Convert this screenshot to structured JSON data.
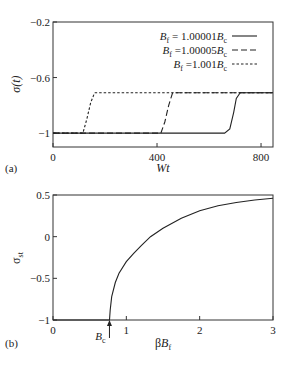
{
  "chart_data": [
    {
      "panel": "(a)",
      "type": "line",
      "xlabel": "Wt",
      "ylabel": "σ(t)",
      "xlim": [
        0,
        846
      ],
      "ylim": [
        -1.1,
        -0.2
      ],
      "xticks": [
        0,
        400,
        800
      ],
      "yticks": [
        -1,
        -0.6,
        -0.2
      ],
      "grid": false,
      "legend_position": "upper right",
      "series": [
        {
          "name": "B_f = 1.00001B_c",
          "style": "solid",
          "x": [
            0,
            660,
            680,
            695,
            705,
            720,
            846
          ],
          "y": [
            -1,
            -1,
            -0.97,
            -0.85,
            -0.75,
            -0.71,
            -0.71
          ]
        },
        {
          "name": "B_f = 1.00005B_c",
          "style": "dashed",
          "x": [
            0,
            415,
            430,
            445,
            460,
            846
          ],
          "y": [
            -1,
            -1,
            -0.92,
            -0.8,
            -0.71,
            -0.71
          ]
        },
        {
          "name": "B_f = 1.001B_c",
          "style": "dotted",
          "x": [
            0,
            115,
            130,
            145,
            160,
            846
          ],
          "y": [
            -1,
            -1,
            -0.9,
            -0.78,
            -0.71,
            -0.71
          ]
        }
      ],
      "legend": [
        {
          "prefix": "B",
          "sub": "f",
          "mid": " = 1.00001",
          "suffix": "B",
          "sub2": "c"
        },
        {
          "prefix": "B",
          "sub": "f",
          "mid": " =1.00005",
          "suffix": "B",
          "sub2": "c"
        },
        {
          "prefix": "B",
          "sub": "f",
          "mid": " =1.001",
          "suffix": "B",
          "sub2": "c"
        }
      ]
    },
    {
      "panel": "(b)",
      "type": "line",
      "xlabel": "βB_f",
      "ylabel": "σ_st",
      "xlim": [
        0,
        3
      ],
      "ylim": [
        -1,
        0.5
      ],
      "xticks": [
        0,
        1,
        2,
        3
      ],
      "yticks": [
        -1,
        -0.5,
        0,
        0.5
      ],
      "grid": false,
      "annotation": {
        "text": "B_c",
        "x": 0.77,
        "arrow": "up"
      },
      "series": [
        {
          "name": "σ_st",
          "style": "solid",
          "x": [
            0,
            0.77,
            0.78,
            0.8,
            0.85,
            0.9,
            1.0,
            1.1,
            1.2,
            1.33,
            1.5,
            1.75,
            2.0,
            2.25,
            2.5,
            2.75,
            3.0
          ],
          "y": [
            -1,
            -1,
            -0.88,
            -0.72,
            -0.55,
            -0.44,
            -0.3,
            -0.2,
            -0.11,
            0,
            0.1,
            0.22,
            0.31,
            0.37,
            0.41,
            0.44,
            0.46
          ]
        }
      ]
    }
  ],
  "labels": {
    "a": {
      "panel": "(a)",
      "xlabel": "Wt",
      "ylabel": "σ(t)",
      "xticks": [
        "0",
        "400",
        "800"
      ],
      "yticks": [
        "−1",
        "−0.6",
        "−0.2"
      ]
    },
    "b": {
      "panel": "(b)",
      "xlabel_main": "β",
      "xlabel_b": "B",
      "xlabel_sub": "f",
      "ylabel_main": "σ",
      "ylabel_sub": "st",
      "xticks": [
        "0",
        "1",
        "2",
        "3"
      ],
      "yticks": [
        "−1",
        "−0.5",
        "0",
        "0.5"
      ],
      "annot_main": "B",
      "annot_sub": "c"
    }
  },
  "colors": {
    "line": "#222222",
    "frame": "#333333"
  }
}
